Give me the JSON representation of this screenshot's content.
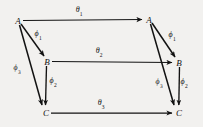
{
  "diagram": {
    "type": "commutative-diagram",
    "background_color": "#f2f1ef",
    "stroke_color": "#121212",
    "nodes": [
      {
        "id": "A-left",
        "label": "A",
        "x": 18,
        "y": 21
      },
      {
        "id": "B-left",
        "label": "B",
        "x": 47,
        "y": 62
      },
      {
        "id": "C-left",
        "label": "C",
        "x": 46,
        "y": 113
      },
      {
        "id": "A-right",
        "label": "A",
        "x": 149,
        "y": 20
      },
      {
        "id": "B-right",
        "label": "B",
        "x": 179,
        "y": 63
      },
      {
        "id": "C-right",
        "label": "C",
        "x": 179,
        "y": 113
      }
    ],
    "edges": [
      {
        "id": "theta-1",
        "from": "A-left",
        "to": "A-right",
        "symbol": "θ",
        "subscript": "1"
      },
      {
        "id": "theta-2",
        "from": "B-left",
        "to": "B-right",
        "symbol": "θ",
        "subscript": "2"
      },
      {
        "id": "theta-3",
        "from": "C-left",
        "to": "C-right",
        "symbol": "θ",
        "subscript": "3"
      },
      {
        "id": "phi-1-left",
        "from": "A-left",
        "to": "B-left",
        "symbol": "ϕ",
        "subscript": "1"
      },
      {
        "id": "phi-2-left",
        "from": "B-left",
        "to": "C-left",
        "symbol": "ϕ",
        "subscript": "2"
      },
      {
        "id": "phi-3-left",
        "from": "A-left",
        "to": "C-left",
        "symbol": "ϕ",
        "subscript": "3"
      },
      {
        "id": "phi-1-right",
        "from": "A-right",
        "to": "B-right",
        "symbol": "ϕ",
        "subscript": "1"
      },
      {
        "id": "phi-2-right",
        "from": "B-right",
        "to": "C-right",
        "symbol": "ϕ",
        "subscript": "2"
      },
      {
        "id": "phi-3-right",
        "from": "A-right",
        "to": "C-right",
        "symbol": "ϕ",
        "subscript": "3"
      }
    ],
    "edge_labels": [
      {
        "id": "theta-1",
        "symbol": "θ",
        "subscript": "1",
        "x": 79,
        "y": 11
      },
      {
        "id": "theta-2",
        "symbol": "θ",
        "subscript": "2",
        "x": 99,
        "y": 52
      },
      {
        "id": "theta-3",
        "symbol": "θ",
        "subscript": "3",
        "x": 101,
        "y": 104
      },
      {
        "id": "phi-1-left",
        "symbol": "ϕ",
        "subscript": "1",
        "x": 38,
        "y": 35
      },
      {
        "id": "phi-2-left",
        "symbol": "ϕ",
        "subscript": "2",
        "x": 53,
        "y": 82
      },
      {
        "id": "phi-3-left",
        "symbol": "ϕ",
        "subscript": "3",
        "x": 17,
        "y": 69
      },
      {
        "id": "phi-1-right",
        "symbol": "ϕ",
        "subscript": "1",
        "x": 172,
        "y": 36
      },
      {
        "id": "phi-2-right",
        "symbol": "ϕ",
        "subscript": "2",
        "x": 184,
        "y": 83
      },
      {
        "id": "phi-3-right",
        "symbol": "ϕ",
        "subscript": "3",
        "x": 159,
        "y": 83
      }
    ]
  }
}
